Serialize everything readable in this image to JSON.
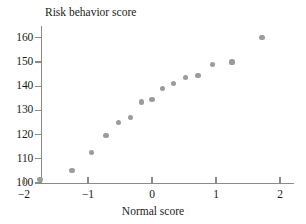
{
  "chart_data": {
    "type": "scatter",
    "title": "Risk behavior score",
    "xlabel": "Normal score",
    "ylabel": "Risk behavior score",
    "xlim": [
      -2.3,
      2.45
    ],
    "ylim": [
      100,
      163
    ],
    "grid": false,
    "legend": "none",
    "xticks": [
      -2,
      -1,
      0,
      1,
      2
    ],
    "xticklabels": [
      "−2",
      "−1",
      "0",
      "1",
      "2"
    ],
    "yticks": [
      100,
      110,
      120,
      130,
      140,
      150,
      160
    ],
    "yticklabels": [
      "100",
      "110",
      "120",
      "130",
      "140",
      "150",
      "160"
    ],
    "x": [
      -1.75,
      -1.25,
      -0.95,
      -0.72,
      -0.52,
      -0.33,
      -0.17,
      0.0,
      0.17,
      0.33,
      0.52,
      0.72,
      0.95,
      1.25,
      1.72
    ],
    "y": [
      101.5,
      105.0,
      112.5,
      119.5,
      125.0,
      127.0,
      133.5,
      134.5,
      139.0,
      141.0,
      143.5,
      144.5,
      149.0,
      150.0,
      160.0
    ],
    "points": [
      {
        "x": -1.75,
        "y": 101.5
      },
      {
        "x": -1.25,
        "y": 105.0
      },
      {
        "x": -0.95,
        "y": 112.5
      },
      {
        "x": -0.72,
        "y": 119.5
      },
      {
        "x": -0.52,
        "y": 125.0
      },
      {
        "x": -0.33,
        "y": 127.0
      },
      {
        "x": -0.17,
        "y": 133.5
      },
      {
        "x": 0.0,
        "y": 134.5
      },
      {
        "x": 0.17,
        "y": 139.0
      },
      {
        "x": 0.33,
        "y": 141.0
      },
      {
        "x": 0.52,
        "y": 143.5
      },
      {
        "x": 0.72,
        "y": 144.5
      },
      {
        "x": 0.95,
        "y": 149.0
      },
      {
        "x": 1.25,
        "y": 150.0
      },
      {
        "x": 1.72,
        "y": 160.0
      }
    ],
    "marker_color": "#9b9b9b",
    "axis_color": "#8a8a8a"
  }
}
